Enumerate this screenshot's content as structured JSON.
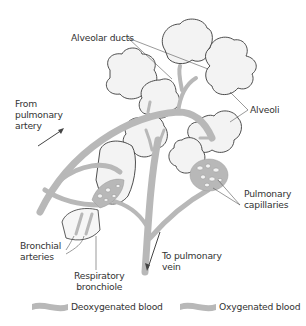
{
  "diagram": {
    "labels": {
      "alveolar_ducts": "Alveolar ducts",
      "alveoli": "Alveoli",
      "from_pulmonary_artery": [
        "From",
        "pulmonary",
        "artery"
      ],
      "pulmonary_capillaries": [
        "Pulmonary",
        "capillaries"
      ],
      "bronchial_arteries": [
        "Bronchial",
        "arteries"
      ],
      "respiratory_bronchiole": [
        "Respiratory",
        "bronchiole"
      ],
      "to_pulmonary_vein": [
        "To pulmonary",
        "vein"
      ]
    },
    "legend": [
      {
        "label": "Deoxygenated blood",
        "color": "#b8b8b8"
      },
      {
        "label": "Oxygenated blood",
        "color": "#b8b8b8"
      }
    ],
    "colors": {
      "vessel": "#b8b8b8",
      "alveolus_fill": "#f3f3f3",
      "outline": "#3a3a3a",
      "text": "#333333"
    }
  }
}
